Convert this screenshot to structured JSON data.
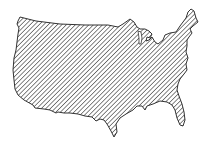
{
  "figure": {
    "fill_style": "diagonal-hatch",
    "colors": {
      "background": "#ffffff",
      "outline": "#333333",
      "hatch": "#444444"
    }
  }
}
